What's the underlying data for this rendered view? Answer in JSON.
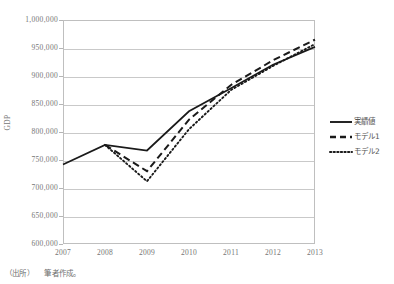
{
  "chart_data": {
    "type": "line",
    "title": "",
    "xlabel": "",
    "ylabel": "GDP",
    "x": [
      2007,
      2008,
      2009,
      2010,
      2011,
      2012,
      2013
    ],
    "xtick_labels": [
      "2007",
      "2008",
      "2009",
      "2010",
      "2011",
      "2012",
      "2013"
    ],
    "ytick_labels": [
      "1,000,000",
      "950,000",
      "900,000",
      "850,000",
      "800,000",
      "750,000",
      "700,000",
      "650,000",
      "600,000"
    ],
    "ytick_values": [
      1000000,
      950000,
      900000,
      850000,
      800000,
      750000,
      700000,
      650000,
      600000
    ],
    "ylim": [
      600000,
      1000000
    ],
    "xlim": [
      2007,
      2013
    ],
    "grid": true,
    "legend_position": "right",
    "series": [
      {
        "name": "実績値",
        "style": "solid",
        "color": "#1a1a1a",
        "values": [
          742000,
          777000,
          767000,
          837000,
          878000,
          920000,
          952000
        ]
      },
      {
        "name": "モデル1",
        "style": "dashed",
        "color": "#1a1a1a",
        "values": [
          null,
          777000,
          730000,
          822000,
          884000,
          928000,
          965000
        ]
      },
      {
        "name": "モデル2",
        "style": "dotted",
        "color": "#1a1a1a",
        "values": [
          null,
          777000,
          712000,
          805000,
          875000,
          918000,
          957000
        ]
      }
    ]
  },
  "legend": {
    "items": [
      {
        "label": "実績値"
      },
      {
        "label": "モデル1"
      },
      {
        "label": "モデル2"
      }
    ]
  },
  "axes": {
    "y_title": "GDP"
  },
  "caption": {
    "source_label": "（出所）",
    "source_text": "筆者作成。"
  }
}
